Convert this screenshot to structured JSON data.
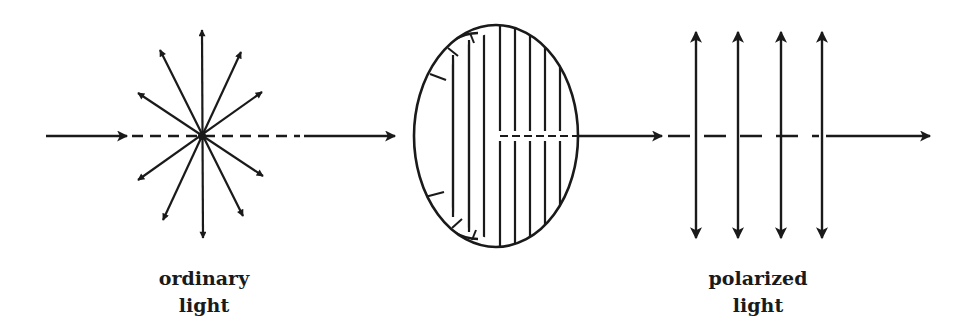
{
  "diagram": {
    "stroke_color": "#1a1a1a",
    "background": "#ffffff",
    "beam_y": 136,
    "incoming_arrow": {
      "x1": 46,
      "x2": 127
    },
    "first_segment": {
      "dash_start": 132,
      "dash_end": 300,
      "solid_end": 395
    },
    "starburst": {
      "center": [
        202,
        136
      ],
      "lines": [
        {
          "name": "vertical",
          "x1": 202,
          "y1": 30,
          "x2": 203,
          "y2": 238
        },
        {
          "name": "steep-right",
          "x1": 241,
          "y1": 52,
          "x2": 163,
          "y2": 220
        },
        {
          "name": "steep-left",
          "x1": 160,
          "y1": 50,
          "x2": 243,
          "y2": 216
        },
        {
          "name": "shallow-left",
          "x1": 138,
          "y1": 93,
          "x2": 263,
          "y2": 176
        },
        {
          "name": "shallow-right",
          "x1": 262,
          "y1": 92,
          "x2": 138,
          "y2": 180
        }
      ]
    },
    "polarizer": {
      "center": [
        496,
        136
      ],
      "rx": 82,
      "ry": 111,
      "hatch_x": [
        453,
        469,
        484,
        500,
        515,
        530,
        545,
        560
      ],
      "dash_start": 500,
      "dash_end": 577
    },
    "middle_arrow": {
      "x1": 577,
      "x2": 662
    },
    "polarized_arrows": {
      "x": [
        696,
        738,
        781,
        822
      ],
      "y1": 32,
      "y2": 238
    },
    "final_segment": {
      "dash_start": 668,
      "dash_end": 822,
      "solid_end": 930
    },
    "labels": {
      "ordinary": {
        "line1": "ordinary",
        "line2": "light"
      },
      "polarized": {
        "line1": "polarized",
        "line2": "light"
      }
    }
  }
}
